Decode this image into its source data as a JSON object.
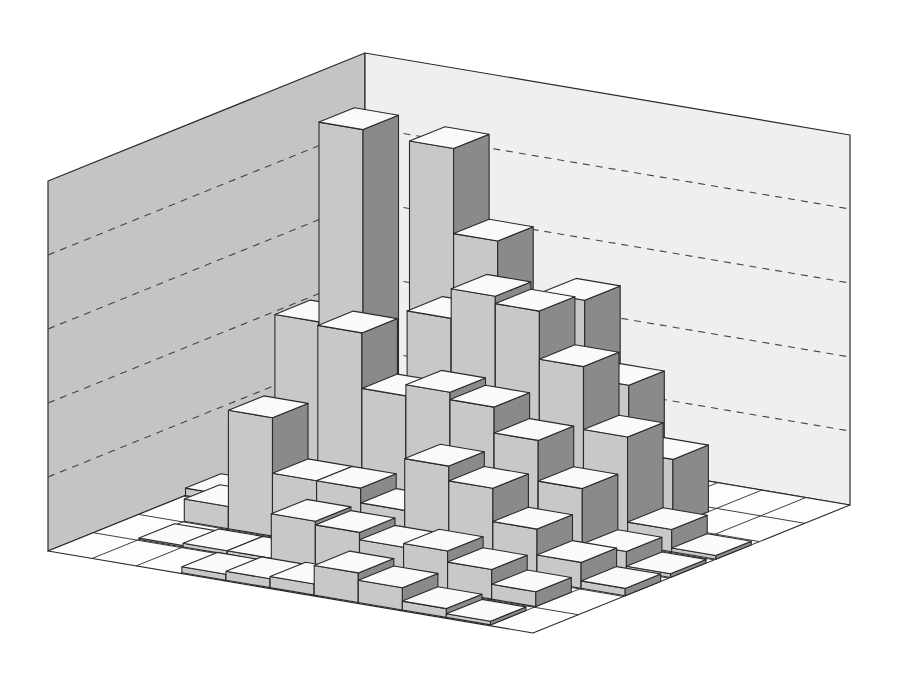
{
  "chart_data": {
    "type": "bar3d",
    "title": "",
    "xlabel": "",
    "ylabel": "",
    "zlabel": "",
    "grid": true,
    "legend": null,
    "z_gridlines": [
      1,
      2,
      3,
      4
    ],
    "zlim": [
      0,
      5
    ],
    "grid_size": {
      "rows_a": 7,
      "cols_b": 11
    },
    "axis_a_note": "runs from back corner toward left-front (7 cells)",
    "axis_b_note": "runs from back corner toward right (11 cells)",
    "heights": [
      [
        0.0,
        0.0,
        4.25,
        3.1,
        0.0,
        0.0,
        0.0,
        0.0,
        0.0,
        0.0,
        0.0
      ],
      [
        0.0,
        0.0,
        0.0,
        0.55,
        1.1,
        2.3,
        2.85,
        1.8,
        0.9,
        0.0,
        0.0
      ],
      [
        0.0,
        2.3,
        5.0,
        0.0,
        2.65,
        3.05,
        2.95,
        2.3,
        1.45,
        0.3,
        0.05
      ],
      [
        0.1,
        0.0,
        0.0,
        2.6,
        1.85,
        2.0,
        1.9,
        1.55,
        1.0,
        0.25,
        0.05
      ],
      [
        0.0,
        0.3,
        1.6,
        0.85,
        0.85,
        0.65,
        1.35,
        1.15,
        0.7,
        0.35,
        0.1
      ],
      [
        0.0,
        0.02,
        0.05,
        0.05,
        0.65,
        0.6,
        0.5,
        0.55,
        0.4,
        0.2,
        0.0
      ],
      [
        0.0,
        0.0,
        0.0,
        0.08,
        0.12,
        0.15,
        0.4,
        0.3,
        0.12,
        0.05,
        0.0
      ]
    ]
  },
  "colors": {
    "left_wall": "#c4c4c4",
    "right_wall": "#efefef",
    "floor": "#fdfdfd",
    "bar_top": "#fafafa",
    "bar_front": "#c8c8c8",
    "bar_side": "#8a8a8a",
    "edge": "#2a2a2a",
    "gridline": "#444444"
  }
}
